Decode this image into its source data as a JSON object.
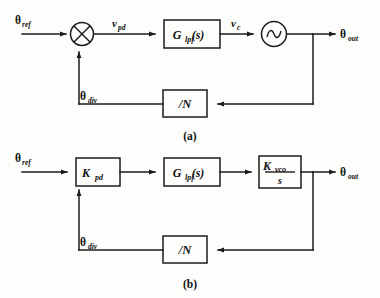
{
  "figure": {
    "background_color": "#fdfdfb",
    "line_color": "#1b1b1b"
  },
  "diagrams": [
    {
      "caption": "(a)",
      "input_label": "θ",
      "input_sub": "ref",
      "output_label": "θ",
      "output_sub": "out",
      "feedback_label": "θ",
      "feedback_sub": "div",
      "signals": [
        {
          "label": "v",
          "sub": "pd"
        },
        {
          "label": "v",
          "sub": "c"
        }
      ],
      "blocks": [
        {
          "name": "mixer",
          "icon": "circle-times-icon",
          "text": "",
          "sub": ""
        },
        {
          "name": "loop-filter",
          "icon": "rect-block",
          "text": "G",
          "sub": "lpf",
          "suffix": "(s)"
        },
        {
          "name": "vco",
          "icon": "circle-sine-icon",
          "text": "",
          "sub": ""
        },
        {
          "name": "divider",
          "icon": "rect-block",
          "text": "/N",
          "sub": ""
        }
      ]
    },
    {
      "caption": "(b)",
      "input_label": "θ",
      "input_sub": "ref",
      "output_label": "θ",
      "output_sub": "out",
      "feedback_label": "θ",
      "feedback_sub": "div",
      "signals": [],
      "blocks": [
        {
          "name": "phase-detector-gain",
          "icon": "rect-block",
          "text": "K",
          "sub": "pd"
        },
        {
          "name": "loop-filter",
          "icon": "rect-block",
          "text": "G",
          "sub": "lpf",
          "suffix": "(s)"
        },
        {
          "name": "vco-gain",
          "icon": "rect-block-fraction",
          "numerator": "K",
          "numerator_sub": "vco",
          "denominator": "s"
        },
        {
          "name": "divider",
          "icon": "rect-block",
          "text": "/N",
          "sub": ""
        }
      ]
    }
  ]
}
